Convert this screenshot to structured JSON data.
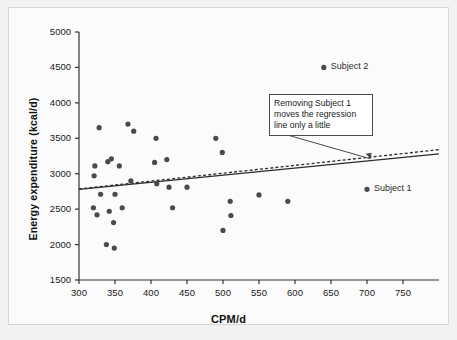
{
  "chart_data": {
    "type": "scatter",
    "title": "",
    "xlabel": "CPM/d",
    "ylabel": "Energy expenditure (kcal/d)",
    "xlim": [
      300,
      800
    ],
    "ylim": [
      1500,
      5000
    ],
    "xticks": [
      300,
      350,
      400,
      450,
      500,
      550,
      600,
      650,
      700,
      750
    ],
    "xticklabels": [
      "300",
      "350",
      "400",
      "450",
      "500",
      "550",
      "600",
      "650",
      "700",
      "750"
    ],
    "yticks": [
      1500,
      2000,
      2500,
      3000,
      3500,
      4000,
      4500,
      5000
    ],
    "yticklabels": [
      "1500",
      "2000",
      "2500",
      "3000",
      "3500",
      "4000",
      "4500",
      "5000"
    ],
    "grid": false,
    "legend": "none",
    "marker_color": "#4a4a4a",
    "marker_size": 4,
    "points": [
      {
        "x": 320,
        "y": 2520
      },
      {
        "x": 321,
        "y": 2970
      },
      {
        "x": 322,
        "y": 3110
      },
      {
        "x": 325,
        "y": 2420
      },
      {
        "x": 328,
        "y": 3650
      },
      {
        "x": 330,
        "y": 2710
      },
      {
        "x": 338,
        "y": 2000
      },
      {
        "x": 340,
        "y": 3170
      },
      {
        "x": 342,
        "y": 2470
      },
      {
        "x": 345,
        "y": 3210
      },
      {
        "x": 348,
        "y": 2310
      },
      {
        "x": 349,
        "y": 1950
      },
      {
        "x": 350,
        "y": 2710
      },
      {
        "x": 356,
        "y": 3110
      },
      {
        "x": 360,
        "y": 2520
      },
      {
        "x": 368,
        "y": 3700
      },
      {
        "x": 372,
        "y": 2900
      },
      {
        "x": 376,
        "y": 3600
      },
      {
        "x": 405,
        "y": 3160
      },
      {
        "x": 407,
        "y": 3500
      },
      {
        "x": 408,
        "y": 2860
      },
      {
        "x": 422,
        "y": 3200
      },
      {
        "x": 425,
        "y": 2810
      },
      {
        "x": 430,
        "y": 2520
      },
      {
        "x": 450,
        "y": 2810
      },
      {
        "x": 490,
        "y": 3500
      },
      {
        "x": 499,
        "y": 3300
      },
      {
        "x": 500,
        "y": 2200
      },
      {
        "x": 510,
        "y": 2610
      },
      {
        "x": 511,
        "y": 2410
      },
      {
        "x": 550,
        "y": 2700
      },
      {
        "x": 590,
        "y": 2610
      },
      {
        "x": 640,
        "y": 4500
      },
      {
        "x": 700,
        "y": 2780
      }
    ],
    "annotated_points": [
      {
        "label": "Subject 2",
        "x": 640,
        "y": 4500
      },
      {
        "label": "Subject 1",
        "x": 700,
        "y": 2780
      }
    ],
    "lines": [
      {
        "name": "regression-with-subject-1",
        "style": "solid",
        "color": "#2b2b2b",
        "x": [
          300,
          800
        ],
        "y": [
          2780,
          3280
        ]
      },
      {
        "name": "regression-without-subject-1",
        "style": "dashed",
        "color": "#2b2b2b",
        "x": [
          300,
          800
        ],
        "y": [
          2785,
          3340
        ]
      }
    ],
    "annotations": [
      {
        "name": "callout",
        "text": "Removing Subject 1 moves the regression line only a little",
        "lines": [
          "Removing Subject 1",
          "moves the regression",
          "line only a little"
        ],
        "target_x": 705,
        "target_y": 3210
      }
    ]
  },
  "axes": {
    "x_title": "CPM/d",
    "y_title": "Energy expenditure (kcal/d)"
  },
  "callout": {
    "line1": "Removing Subject 1",
    "line2": "moves the regression",
    "line3": "line only a little"
  },
  "labels": {
    "subject2": "Subject 2",
    "subject1": "Subject 1"
  }
}
